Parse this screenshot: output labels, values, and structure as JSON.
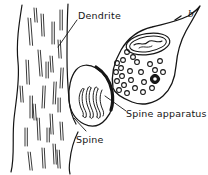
{
  "figure": {
    "panel_letter": "b",
    "ink_color": "#151515",
    "background_color": "#ffffff"
  },
  "labels": {
    "dendrite": "Dendrite",
    "spine": "Spine",
    "spine_apparatus": "Spine apparatus"
  },
  "structures": {
    "dendrite_shaft": "dendrite-shaft",
    "microtubules": "microtubules",
    "spine_head": "spine-head",
    "spine_neck": "spine-neck",
    "spine_apparatus_lamellae": "spine-apparatus-lamellae",
    "postsynaptic_density": "postsynaptic-density",
    "axon_terminal": "axon-terminal-bouton",
    "mitochondrion": "mitochondrion",
    "synaptic_vesicles": "synaptic-vesicles",
    "dense_core_vesicle": "dense-core-vesicle"
  }
}
